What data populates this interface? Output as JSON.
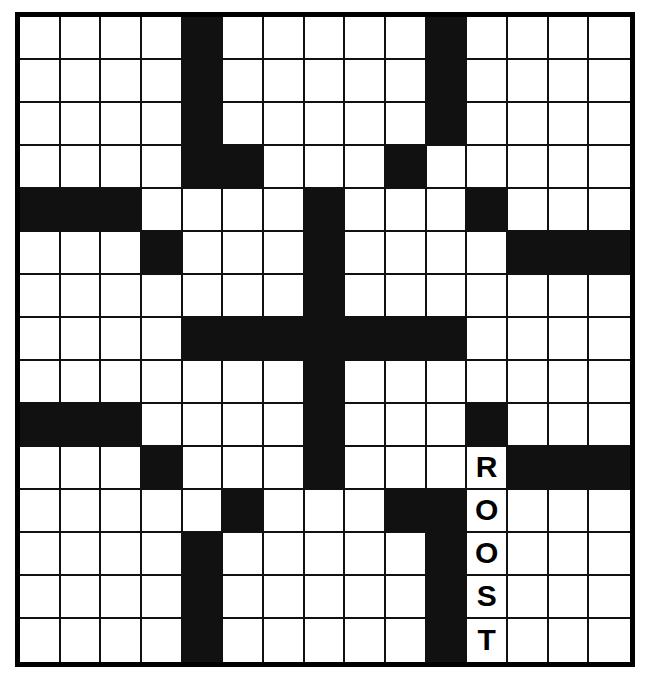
{
  "puzzle": {
    "title": "Crossword Grid",
    "rows": 15,
    "columns": 15,
    "colors": {
      "block": "#111111",
      "open": "#ffffff",
      "border": "#000000",
      "letter": "#000000"
    },
    "legend": {
      "open_cell": "open-square",
      "block_cell": "black-square",
      "filled_cell": "letter-square"
    },
    "answers_visible": [
      {
        "entry": "ROOST",
        "direction": "down",
        "start_row": 11,
        "start_column": 12,
        "letters": [
          "R",
          "O",
          "O",
          "S",
          "T"
        ]
      }
    ],
    "grid": [
      [
        "",
        "",
        "",
        "",
        "#",
        "",
        "",
        "",
        "",
        "",
        "#",
        "",
        "",
        "",
        ""
      ],
      [
        "",
        "",
        "",
        "",
        "#",
        "",
        "",
        "",
        "",
        "",
        "#",
        "",
        "",
        "",
        ""
      ],
      [
        "",
        "",
        "",
        "",
        "#",
        "",
        "",
        "",
        "",
        "",
        "#",
        "",
        "",
        "",
        ""
      ],
      [
        "",
        "",
        "",
        "",
        "#",
        "#",
        "",
        "",
        "",
        "#",
        "",
        "",
        "",
        "",
        ""
      ],
      [
        "#",
        "#",
        "#",
        "",
        "",
        "",
        "",
        "#",
        "",
        "",
        "",
        "#",
        "",
        "",
        ""
      ],
      [
        "",
        "",
        "",
        "#",
        "",
        "",
        "",
        "#",
        "",
        "",
        "",
        "",
        "#",
        "#",
        "#"
      ],
      [
        "",
        "",
        "",
        "",
        "",
        "",
        "",
        "#",
        "",
        "",
        "",
        "",
        "",
        "",
        ""
      ],
      [
        "",
        "",
        "",
        "",
        "#",
        "#",
        "#",
        "#",
        "#",
        "#",
        "#",
        "",
        "",
        "",
        ""
      ],
      [
        "",
        "",
        "",
        "",
        "",
        "",
        "",
        "#",
        "",
        "",
        "",
        "",
        "",
        "",
        ""
      ],
      [
        "#",
        "#",
        "#",
        "",
        "",
        "",
        "",
        "#",
        "",
        "",
        "",
        "#",
        "",
        "",
        ""
      ],
      [
        "",
        "",
        "",
        "#",
        "",
        "",
        "",
        "#",
        "",
        "",
        "",
        "R",
        "#",
        "#",
        "#"
      ],
      [
        "",
        "",
        "",
        "",
        "",
        "#",
        "",
        "",
        "",
        "#",
        "#",
        "O",
        "",
        "",
        ""
      ],
      [
        "",
        "",
        "",
        "",
        "#",
        "",
        "",
        "",
        "",
        "",
        "#",
        "O",
        "",
        "",
        ""
      ],
      [
        "",
        "",
        "",
        "",
        "#",
        "",
        "",
        "",
        "",
        "",
        "#",
        "S",
        "",
        "",
        ""
      ],
      [
        "",
        "",
        "",
        "",
        "#",
        "",
        "",
        "",
        "",
        "",
        "#",
        "T",
        "",
        "",
        ""
      ]
    ]
  }
}
